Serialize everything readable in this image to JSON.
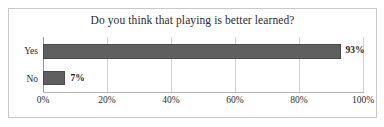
{
  "chart_data": {
    "type": "bar",
    "orientation": "horizontal",
    "title": "Do you think that playing is better learned?",
    "categories": [
      "Yes",
      "No"
    ],
    "values": [
      93,
      7
    ],
    "value_labels": [
      "93%",
      "7%"
    ],
    "xlabel": "",
    "ylabel": "",
    "xlim": [
      0,
      100
    ],
    "xticks": [
      0,
      20,
      40,
      60,
      80,
      100
    ],
    "xtick_labels": [
      "0%",
      "20%",
      "40%",
      "60%",
      "80%",
      "100%"
    ],
    "grid": true,
    "grid_axis": "x",
    "legend": false,
    "series": [
      {
        "name": "Responses",
        "values": [
          93,
          7
        ],
        "color": "#5f5f5f"
      }
    ],
    "colors": {
      "bar_fill": "#5f5f5f",
      "bar_border": "#4a4a4a",
      "gridline": "#d2d2d2",
      "axis_line": "#9a9a9a",
      "frame_border": "#c8c8c8",
      "background": "#ffffff",
      "text": "#2c2c2c"
    }
  }
}
